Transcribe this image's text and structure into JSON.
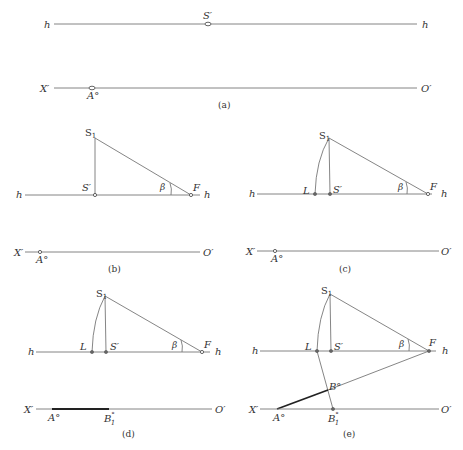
{
  "figure": {
    "panels": [
      {
        "id": "a",
        "caption": "(a)",
        "horizon_label_left": "h",
        "horizon_label_right": "h",
        "point_s_prime": "S′",
        "ground_left": "X′",
        "ground_right": "O′",
        "point_a": "A°"
      },
      {
        "id": "b",
        "caption": "(b)",
        "horizon_label_left": "h",
        "horizon_label_right": "h",
        "point_s1": "S",
        "point_s1_sub": "1",
        "point_s_prime": "S′",
        "point_f": "F",
        "angle": "β",
        "ground_left": "X′",
        "ground_right": "O′",
        "point_a": "A°"
      },
      {
        "id": "c",
        "caption": "(c)",
        "horizon_label_left": "h",
        "horizon_label_right": "h",
        "point_s1": "S",
        "point_s1_sub": "1",
        "point_s_prime": "S′",
        "point_l": "L",
        "point_f": "F",
        "angle": "β",
        "ground_left": "X′",
        "ground_right": "O′",
        "point_a": "A°"
      },
      {
        "id": "d",
        "caption": "(d)",
        "horizon_label_left": "h",
        "horizon_label_right": "h",
        "point_s1": "S",
        "point_s1_sub": "1",
        "point_s_prime": "S′",
        "point_l": "L",
        "point_f": "F",
        "angle": "β",
        "ground_left": "X′",
        "ground_right": "O′",
        "point_a": "A°",
        "point_b1": "B",
        "point_b1_sup": "°",
        "point_b1_sub": "1"
      },
      {
        "id": "e",
        "caption": "(e)",
        "horizon_label_left": "h",
        "horizon_label_right": "h",
        "point_s1": "S",
        "point_s1_sub": "1",
        "point_s_prime": "S′",
        "point_l": "L",
        "point_f": "F",
        "angle": "β",
        "ground_left": "X′",
        "ground_right": "O′",
        "point_a": "A°",
        "point_b": "B°",
        "point_b1": "B",
        "point_b1_sup": "°",
        "point_b1_sub": "1"
      }
    ]
  }
}
